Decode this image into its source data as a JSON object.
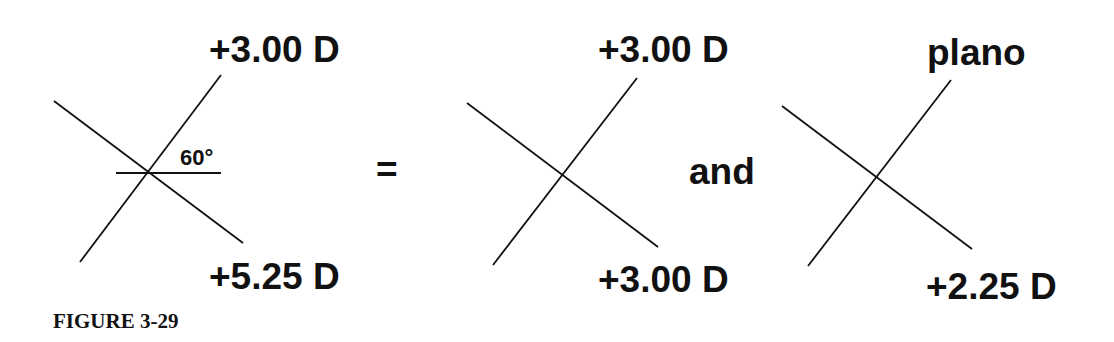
{
  "figure": {
    "caption": "FIGURE 3-29",
    "equals_sign": "=",
    "conjunction": "and"
  },
  "crosses": [
    {
      "name": "original-lens",
      "top_label": "+3.00 D",
      "bottom_label": "+5.25 D",
      "angle_label": "60°",
      "has_reference_line": true
    },
    {
      "name": "spherical-component",
      "top_label": "+3.00 D",
      "bottom_label": "+3.00 D"
    },
    {
      "name": "cylindrical-component",
      "top_label": "plano",
      "bottom_label": "+2.25 D"
    }
  ]
}
